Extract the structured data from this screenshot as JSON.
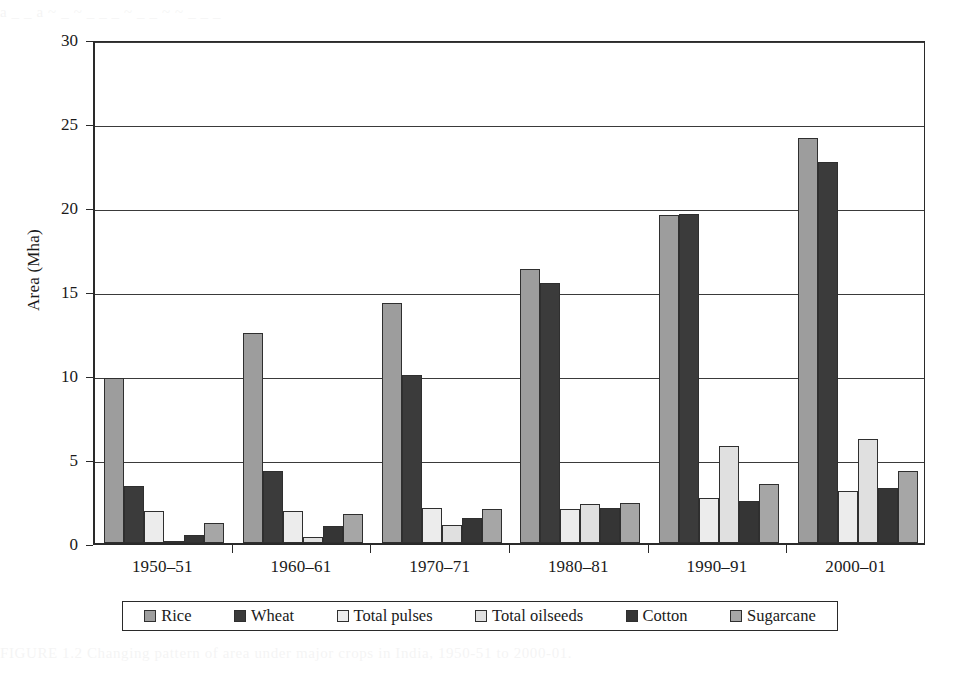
{
  "figure": {
    "ylabel": "Area (Mha)",
    "bleed_top": "a  _  _  a      ~  _      ~ _    _ _  ~     _  _ ~   ~ _   _       _ ",
    "bleed_bottom": "FIGURE 1.2  Changing pattern of area under major crops in India, 1950-51 to 2000-01."
  },
  "chart_data": {
    "type": "bar",
    "title": "",
    "subtitle": "",
    "xlabel": "",
    "ylabel": "Area (Mha)",
    "ylim": [
      0,
      30
    ],
    "yticks": [
      0,
      5,
      10,
      15,
      20,
      25,
      30
    ],
    "ytick_labels": [
      "0",
      "5",
      "10",
      "15",
      "20",
      "25",
      "30"
    ],
    "grid": "horizontal",
    "legend_position": "bottom",
    "categories": [
      "1950–51",
      "1960–61",
      "1970–71",
      "1980–81",
      "1990–91",
      "2000–01"
    ],
    "series": [
      {
        "name": "Rice",
        "color": "#9d9d9d",
        "values": [
          9.8,
          12.5,
          14.3,
          16.3,
          19.5,
          24.1
        ]
      },
      {
        "name": "Wheat",
        "color": "#3b3b3b",
        "values": [
          3.4,
          4.3,
          10.0,
          15.5,
          19.6,
          22.7
        ]
      },
      {
        "name": "Total pulses",
        "color": "#ececec",
        "values": [
          1.9,
          1.9,
          2.1,
          2.0,
          2.7,
          3.1
        ]
      },
      {
        "name": "Total oilseeds",
        "color": "#e0e0e0",
        "values": [
          0.05,
          0.35,
          1.1,
          2.3,
          5.8,
          6.2
        ]
      },
      {
        "name": "Cotton",
        "color": "#353535",
        "values": [
          0.5,
          1.0,
          1.5,
          2.1,
          2.5,
          3.3
        ]
      },
      {
        "name": "Sugarcane",
        "color": "#a6a6a6",
        "values": [
          1.2,
          1.7,
          2.0,
          2.4,
          3.5,
          4.3
        ]
      }
    ]
  }
}
